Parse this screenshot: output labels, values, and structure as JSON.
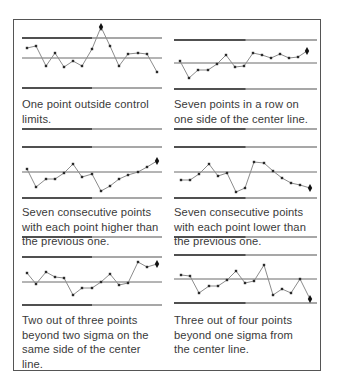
{
  "figure": {
    "panels": [
      {
        "id": "rule-1",
        "caption": "One point outside control limits.",
        "caption_lines": [
          "One point outside control",
          "limits."
        ],
        "lines": {
          "ucl_y": 38,
          "cl_y": 58,
          "lcl_y": 88,
          "x_start": 22,
          "x_end": 162
        },
        "points": [
          [
            27,
            48
          ],
          [
            36,
            46
          ],
          [
            46,
            66
          ],
          [
            55,
            53
          ],
          [
            64,
            67
          ],
          [
            73,
            61
          ],
          [
            82,
            66
          ],
          [
            92,
            49
          ],
          [
            101,
            27
          ],
          [
            110,
            46
          ],
          [
            119,
            66
          ],
          [
            128,
            54
          ],
          [
            138,
            53
          ],
          [
            147,
            54
          ],
          [
            157,
            72
          ]
        ],
        "highlight_index": 8
      },
      {
        "id": "rule-2",
        "caption": "Seven points in a row on one side of the center line.",
        "caption_lines": [
          "Seven points in a row on",
          "one side of the center line."
        ],
        "lines": {
          "ucl_y": 40,
          "cl_y": 63,
          "lcl_y": 89,
          "x_start": 174,
          "x_end": 317
        },
        "points": [
          [
            180,
            61
          ],
          [
            189,
            78
          ],
          [
            198,
            70
          ],
          [
            208,
            70
          ],
          [
            217,
            64
          ],
          [
            226,
            55
          ],
          [
            235,
            67
          ],
          [
            244,
            66
          ],
          [
            253,
            53
          ],
          [
            262,
            55
          ],
          [
            271,
            58
          ],
          [
            280,
            54
          ],
          [
            289,
            58
          ],
          [
            298,
            57
          ],
          [
            307,
            51
          ]
        ],
        "highlight_index": 14
      },
      {
        "id": "rule-3",
        "caption": "Seven consecutive points with each point higher than the previous one.",
        "caption_lines": [
          "Seven consecutive points",
          "with each point higher than",
          "the previous one."
        ],
        "lines": {
          "ucl_y": 147,
          "cl_y": 172,
          "lcl_y": 198,
          "x_start": 22,
          "x_end": 162
        },
        "points": [
          [
            27,
            169
          ],
          [
            36,
            187
          ],
          [
            46,
            179
          ],
          [
            55,
            179
          ],
          [
            64,
            173
          ],
          [
            73,
            164
          ],
          [
            82,
            177
          ],
          [
            92,
            174
          ],
          [
            101,
            191
          ],
          [
            110,
            186
          ],
          [
            119,
            179
          ],
          [
            128,
            175
          ],
          [
            138,
            172
          ],
          [
            147,
            167
          ],
          [
            157,
            161
          ]
        ],
        "highlight_index": 14
      },
      {
        "id": "rule-4",
        "caption": "Seven consecutive points with each point lower than the previous one.",
        "caption_lines": [
          "Seven consecutive points",
          "with each point lower than",
          "the previous one."
        ],
        "lines": {
          "ucl_y": 147,
          "cl_y": 172,
          "lcl_y": 198,
          "x_start": 174,
          "x_end": 317
        },
        "points": [
          [
            181,
            180
          ],
          [
            190,
            180
          ],
          [
            199,
            174
          ],
          [
            209,
            164
          ],
          [
            218,
            176
          ],
          [
            227,
            173
          ],
          [
            236,
            192
          ],
          [
            245,
            188
          ],
          [
            254,
            162
          ],
          [
            264,
            163
          ],
          [
            273,
            171
          ],
          [
            282,
            178
          ],
          [
            291,
            183
          ],
          [
            300,
            185
          ],
          [
            310,
            188
          ]
        ],
        "highlight_index": 14
      },
      {
        "id": "rule-5",
        "caption": "Two out of three points beyond two sigma on the same side of the center line.",
        "caption_lines": [
          "Two out of three points",
          "beyond two sigma on the",
          "same side of the center",
          "line."
        ],
        "lines": {
          "ucl_y": 257,
          "cl_y": 282,
          "lcl_y": 305,
          "x_start": 22,
          "x_end": 162
        },
        "points": [
          [
            27,
            273
          ],
          [
            36,
            284
          ],
          [
            46,
            272
          ],
          [
            55,
            277
          ],
          [
            64,
            278
          ],
          [
            73,
            295
          ],
          [
            82,
            288
          ],
          [
            92,
            288
          ],
          [
            101,
            282
          ],
          [
            110,
            274
          ],
          [
            119,
            285
          ],
          [
            128,
            283
          ],
          [
            138,
            262
          ],
          [
            147,
            267
          ],
          [
            157,
            264
          ]
        ],
        "highlight_index": 14
      },
      {
        "id": "rule-6",
        "caption": "Three out of four points beyond one sigma from the center line.",
        "caption_lines": [
          "Three out of four points",
          "beyond one sigma from",
          "the center line."
        ],
        "lines": {
          "ucl_y": 255,
          "cl_y": 279,
          "lcl_y": 303,
          "x_start": 174,
          "x_end": 317
        },
        "points": [
          [
            181,
            275
          ],
          [
            190,
            276
          ],
          [
            199,
            293
          ],
          [
            209,
            286
          ],
          [
            218,
            286
          ],
          [
            227,
            280
          ],
          [
            236,
            271
          ],
          [
            245,
            283
          ],
          [
            254,
            281
          ],
          [
            264,
            265
          ],
          [
            273,
            295
          ],
          [
            282,
            289
          ],
          [
            291,
            293
          ],
          [
            300,
            279
          ],
          [
            310,
            299
          ]
        ],
        "highlight_index": 14
      }
    ],
    "separators": [
      {
        "y": 129,
        "x_start": 22,
        "x_end": 162
      },
      {
        "y": 129,
        "x_start": 174,
        "x_end": 317
      },
      {
        "y": 237,
        "x_start": 22,
        "x_end": 162
      },
      {
        "y": 237,
        "x_start": 174,
        "x_end": 317
      }
    ],
    "colors": {
      "line_dark": "#333333",
      "line_light": "#8a8a8a",
      "series": "#8c8c8c",
      "marker": "#2a2a2a"
    }
  }
}
